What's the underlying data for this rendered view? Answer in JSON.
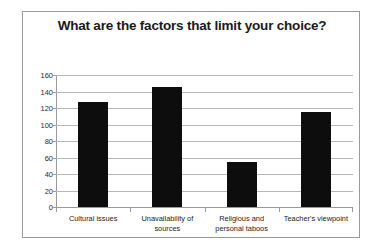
{
  "chart_data": {
    "type": "bar",
    "title": "What are the factors that limit your choice?",
    "categories": [
      "Cultural issues",
      "Unavailability of sources",
      "Religious and personal taboos",
      "Teacher's viewpoint"
    ],
    "values": [
      127,
      145,
      54,
      115
    ],
    "xlabel": "",
    "ylabel": "",
    "ylim": [
      0,
      160
    ],
    "yticks": [
      0,
      20,
      40,
      60,
      80,
      100,
      120,
      140,
      160
    ],
    "ytick_labels": [
      "0",
      "20",
      "40",
      "60",
      "80",
      "100",
      "120",
      "140",
      "160"
    ],
    "grid": true,
    "legend": false,
    "bar_color": "#0d0d0d",
    "gridline_color": "#b7b7b7",
    "axis_color": "#9a9a9a",
    "background": "#ffffff"
  },
  "frame": {
    "border_color": "#9a9a9a"
  }
}
